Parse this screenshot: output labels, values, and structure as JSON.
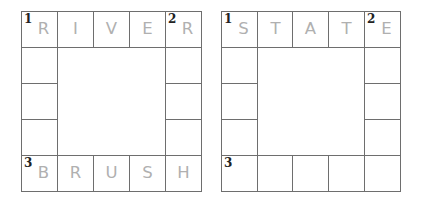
{
  "puzzles": [
    {
      "name": "left",
      "top_row": [
        {
          "num": "1",
          "letter": "R"
        },
        {
          "num": "",
          "letter": "I"
        },
        {
          "num": "",
          "letter": "V"
        },
        {
          "num": "",
          "letter": "E"
        },
        {
          "num": "2",
          "letter": "R"
        }
      ],
      "left_col_middle": [
        "",
        "",
        ""
      ],
      "right_col_middle": [
        "",
        "",
        ""
      ],
      "bottom_row": [
        {
          "num": "3",
          "letter": "B"
        },
        {
          "num": "",
          "letter": "R"
        },
        {
          "num": "",
          "letter": "U"
        },
        {
          "num": "",
          "letter": "S"
        },
        {
          "num": "",
          "letter": "H"
        }
      ]
    },
    {
      "name": "right",
      "top_row": [
        {
          "num": "1",
          "letter": "S"
        },
        {
          "num": "",
          "letter": "T"
        },
        {
          "num": "",
          "letter": "A"
        },
        {
          "num": "",
          "letter": "T"
        },
        {
          "num": "2",
          "letter": "E"
        }
      ],
      "left_col_middle": [
        "",
        "",
        ""
      ],
      "right_col_middle": [
        "",
        "",
        ""
      ],
      "bottom_row": [
        {
          "num": "3",
          "letter": ""
        },
        {
          "num": "",
          "letter": ""
        },
        {
          "num": "",
          "letter": ""
        },
        {
          "num": "",
          "letter": ""
        },
        {
          "num": "",
          "letter": ""
        }
      ]
    }
  ]
}
